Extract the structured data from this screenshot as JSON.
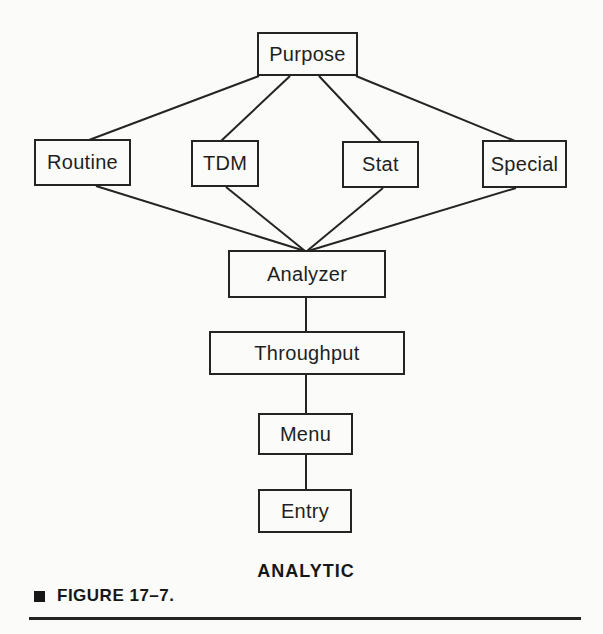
{
  "figure": {
    "diagram_label": "ANALYTIC",
    "caption_label": "FIGURE 17–7."
  },
  "diagram": {
    "nodes": [
      {
        "id": "purpose",
        "label": "Purpose"
      },
      {
        "id": "routine",
        "label": "Routine"
      },
      {
        "id": "tdm",
        "label": "TDM"
      },
      {
        "id": "stat",
        "label": "Stat"
      },
      {
        "id": "special",
        "label": "Special"
      },
      {
        "id": "analyzer",
        "label": "Analyzer"
      },
      {
        "id": "throughput",
        "label": "Throughput"
      },
      {
        "id": "menu",
        "label": "Menu"
      },
      {
        "id": "entry",
        "label": "Entry"
      }
    ],
    "edges": [
      {
        "from": "purpose",
        "to": "routine"
      },
      {
        "from": "purpose",
        "to": "tdm"
      },
      {
        "from": "purpose",
        "to": "stat"
      },
      {
        "from": "purpose",
        "to": "special"
      },
      {
        "from": "routine",
        "to": "analyzer"
      },
      {
        "from": "tdm",
        "to": "analyzer"
      },
      {
        "from": "stat",
        "to": "analyzer"
      },
      {
        "from": "special",
        "to": "analyzer"
      },
      {
        "from": "analyzer",
        "to": "throughput"
      },
      {
        "from": "throughput",
        "to": "menu"
      },
      {
        "from": "menu",
        "to": "entry"
      }
    ]
  },
  "colors": {
    "ink": "#242424",
    "paper": "#fbfbf9"
  }
}
